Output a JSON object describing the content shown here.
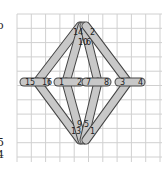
{
  "diagram": {
    "title": "",
    "colors": {
      "grid": "#d0d0d0",
      "bar_fill": "#c8c8c8",
      "bar_stroke": "#444444",
      "label": "#222222",
      "background": "#ffffff"
    },
    "grid": {
      "x0": 17,
      "y0": 14,
      "x1": 162,
      "y1": 162,
      "step": 14.3
    },
    "edge_glyphs": [
      {
        "text": "o",
        "x": -3,
        "y": 20
      },
      {
        "text": "5",
        "x": -3,
        "y": 137
      },
      {
        "text": "4",
        "x": -3,
        "y": 149
      }
    ],
    "bars": [
      {
        "id": "h-left",
        "x1": 24,
        "y1": 82,
        "x2": 46,
        "y2": 82,
        "labels": [
          {
            "text": "15",
            "x": 25,
            "y": 82
          },
          {
            "text": "16",
            "x": 42,
            "y": 82
          }
        ]
      },
      {
        "id": "h-midleft",
        "x1": 58,
        "y1": 82,
        "x2": 80,
        "y2": 82,
        "labels": [
          {
            "text": "1",
            "x": 59,
            "y": 82
          },
          {
            "text": "2",
            "x": 77,
            "y": 82
          }
        ]
      },
      {
        "id": "h-midright",
        "x1": 86,
        "y1": 82,
        "x2": 107,
        "y2": 82,
        "labels": [
          {
            "text": "7",
            "x": 86,
            "y": 82
          },
          {
            "text": "8",
            "x": 104,
            "y": 82
          }
        ]
      },
      {
        "id": "h-right",
        "x1": 119,
        "y1": 82,
        "x2": 141,
        "y2": 82,
        "labels": [
          {
            "text": "3",
            "x": 120,
            "y": 82
          },
          {
            "text": "4",
            "x": 138,
            "y": 82
          }
        ]
      },
      {
        "id": "d-top-left",
        "x1": 80,
        "y1": 26,
        "x2": 37,
        "y2": 82,
        "labels": [
          {
            "text": "14",
            "x": 73,
            "y": 32
          }
        ]
      },
      {
        "id": "d-top-midleft",
        "x1": 82,
        "y1": 26,
        "x2": 66,
        "y2": 82,
        "labels": [
          {
            "text": "10",
            "x": 78,
            "y": 42
          }
        ]
      },
      {
        "id": "d-top-midright",
        "x1": 84,
        "y1": 26,
        "x2": 98,
        "y2": 82,
        "labels": [
          {
            "text": "6",
            "x": 86,
            "y": 42
          }
        ]
      },
      {
        "id": "d-top-right",
        "x1": 86,
        "y1": 26,
        "x2": 128,
        "y2": 82,
        "labels": [
          {
            "text": "2",
            "x": 90,
            "y": 32
          }
        ]
      },
      {
        "id": "d-bot-left",
        "x1": 37,
        "y1": 82,
        "x2": 80,
        "y2": 140,
        "labels": [
          {
            "text": "13",
            "x": 71,
            "y": 131
          }
        ]
      },
      {
        "id": "d-bot-midleft",
        "x1": 66,
        "y1": 82,
        "x2": 82,
        "y2": 140,
        "labels": [
          {
            "text": "9",
            "x": 77,
            "y": 124
          }
        ]
      },
      {
        "id": "d-bot-midright",
        "x1": 98,
        "y1": 82,
        "x2": 84,
        "y2": 140,
        "labels": [
          {
            "text": "5",
            "x": 84,
            "y": 124
          }
        ]
      },
      {
        "id": "d-bot-right",
        "x1": 128,
        "y1": 82,
        "x2": 86,
        "y2": 140,
        "labels": [
          {
            "text": "1",
            "x": 90,
            "y": 131
          }
        ]
      }
    ]
  }
}
